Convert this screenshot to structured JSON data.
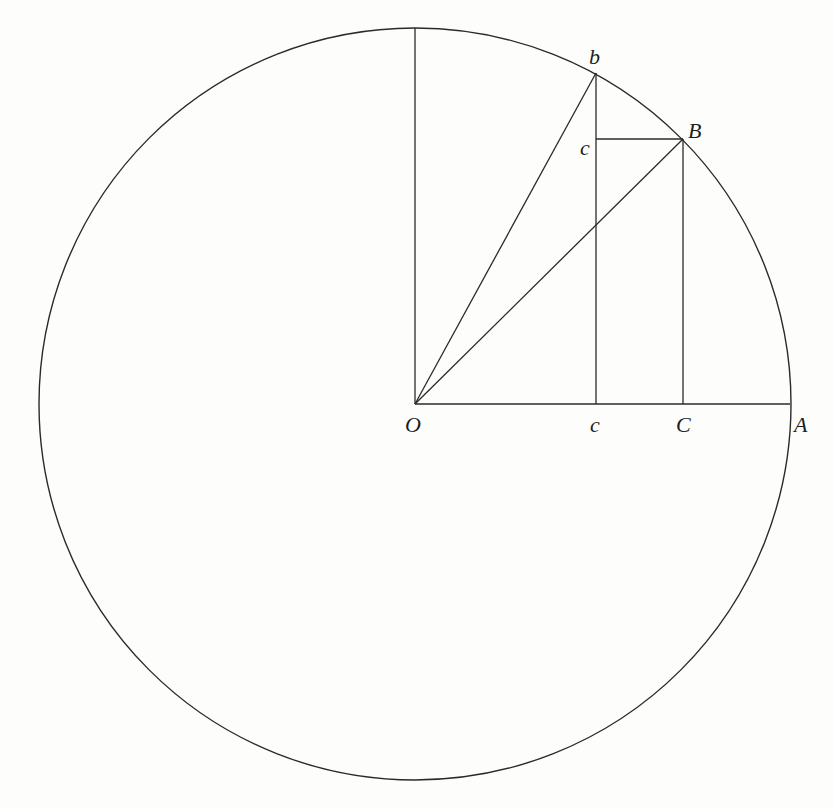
{
  "figure": {
    "type": "geometric-construction",
    "stroke_color": "#2a2a2a",
    "circle": {
      "center": [
        415,
        404
      ],
      "radius": 376
    },
    "points": {
      "O": {
        "label": "O",
        "x": 415,
        "y": 404
      },
      "A": {
        "label": "A",
        "x": 790,
        "y": 404
      },
      "b": {
        "label": "b",
        "x": 596,
        "y": 73
      },
      "B": {
        "label": "B",
        "x": 683,
        "y": 139
      },
      "c_upper": {
        "label": "c",
        "x": 596,
        "y": 139
      },
      "c_lower": {
        "label": "c",
        "x": 596,
        "y": 404
      },
      "C": {
        "label": "C",
        "x": 683,
        "y": 404
      },
      "top": {
        "x": 415,
        "y": 28
      }
    },
    "labels": {
      "O": "O",
      "A": "A",
      "b": "b",
      "B": "B",
      "c_upper": "c",
      "c_lower": "c",
      "C": "C"
    }
  }
}
